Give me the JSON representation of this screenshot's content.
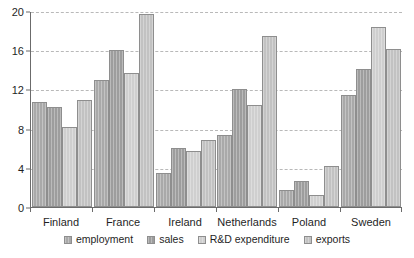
{
  "chart_data": {
    "type": "bar",
    "title": "",
    "subtitle": "",
    "xlabel": "",
    "ylabel": "",
    "ylim": [
      0,
      20
    ],
    "yticks": [
      0,
      4,
      8,
      12,
      16,
      20
    ],
    "ytick_labels": [
      "0",
      "4",
      "8",
      "12",
      "16",
      "20"
    ],
    "grid": true,
    "grid_style": "dashed-horizontal",
    "legend_position": "bottom-center",
    "categories": [
      "Finland",
      "France",
      "Ireland",
      "Netherlands",
      "Poland",
      "Sweden"
    ],
    "series": [
      {
        "name": "employment",
        "color": "#a9a9a9",
        "values": [
          10.7,
          13.0,
          3.5,
          7.3,
          1.7,
          11.4
        ]
      },
      {
        "name": "sales",
        "color": "#9d9d9d",
        "values": [
          10.2,
          16.0,
          6.0,
          12.0,
          2.7,
          14.1
        ]
      },
      {
        "name": "R&D expenditure",
        "color": "#cfcfcf",
        "values": [
          8.2,
          13.7,
          5.7,
          10.4,
          1.2,
          18.4
        ]
      },
      {
        "name": "exports",
        "color": "#c2c2c2",
        "values": [
          10.9,
          19.7,
          6.8,
          17.5,
          4.2,
          16.1
        ]
      }
    ]
  },
  "colors": {
    "axis": "#6b6b6b",
    "gridline": "#b9b9b9",
    "text": "#1f1f1f",
    "background": "#ffffff",
    "bar_outline": "#8e8e8e"
  }
}
